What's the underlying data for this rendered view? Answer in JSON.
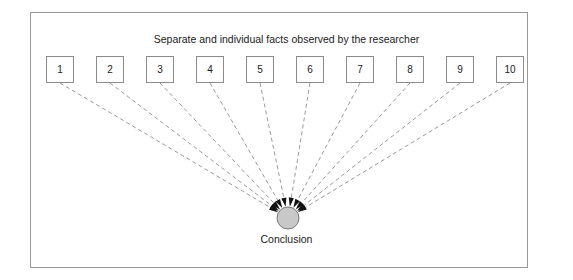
{
  "figure": {
    "title": "Separate and individual facts observed by the researcher",
    "conclusion_label": "Conclusion",
    "frame_color": "#999999",
    "background_color": "#ffffff"
  },
  "facts": [
    {
      "label": "1"
    },
    {
      "label": "2"
    },
    {
      "label": "3"
    },
    {
      "label": "4"
    },
    {
      "label": "5"
    },
    {
      "label": "6"
    },
    {
      "label": "7"
    },
    {
      "label": "8"
    },
    {
      "label": "9"
    },
    {
      "label": "10"
    }
  ],
  "conclusion_node": {
    "fill_color": "#c8c8c8",
    "stroke_color": "#777777",
    "center_x": 288,
    "center_y": 218,
    "radius": 11
  },
  "connectors": {
    "style": "dashed",
    "color": "#9a9a9a",
    "arrowhead_color": "#111111",
    "count": 10,
    "direction": "facts-to-conclusion"
  },
  "chart_data": {
    "type": "diagram",
    "diagram_kind": "inductive-reasoning-convergence",
    "title": "Separate and individual facts observed by the researcher",
    "nodes": [
      "1",
      "2",
      "3",
      "4",
      "5",
      "6",
      "7",
      "8",
      "9",
      "10"
    ],
    "target": "Conclusion",
    "edges": [
      {
        "from": "1",
        "to": "Conclusion"
      },
      {
        "from": "2",
        "to": "Conclusion"
      },
      {
        "from": "3",
        "to": "Conclusion"
      },
      {
        "from": "4",
        "to": "Conclusion"
      },
      {
        "from": "5",
        "to": "Conclusion"
      },
      {
        "from": "6",
        "to": "Conclusion"
      },
      {
        "from": "7",
        "to": "Conclusion"
      },
      {
        "from": "8",
        "to": "Conclusion"
      },
      {
        "from": "9",
        "to": "Conclusion"
      },
      {
        "from": "10",
        "to": "Conclusion"
      }
    ]
  },
  "geometry": {
    "box_start_x": 46,
    "box_top_y": 56,
    "box_width": 28,
    "box_height": 27,
    "box_spacing": 50
  }
}
